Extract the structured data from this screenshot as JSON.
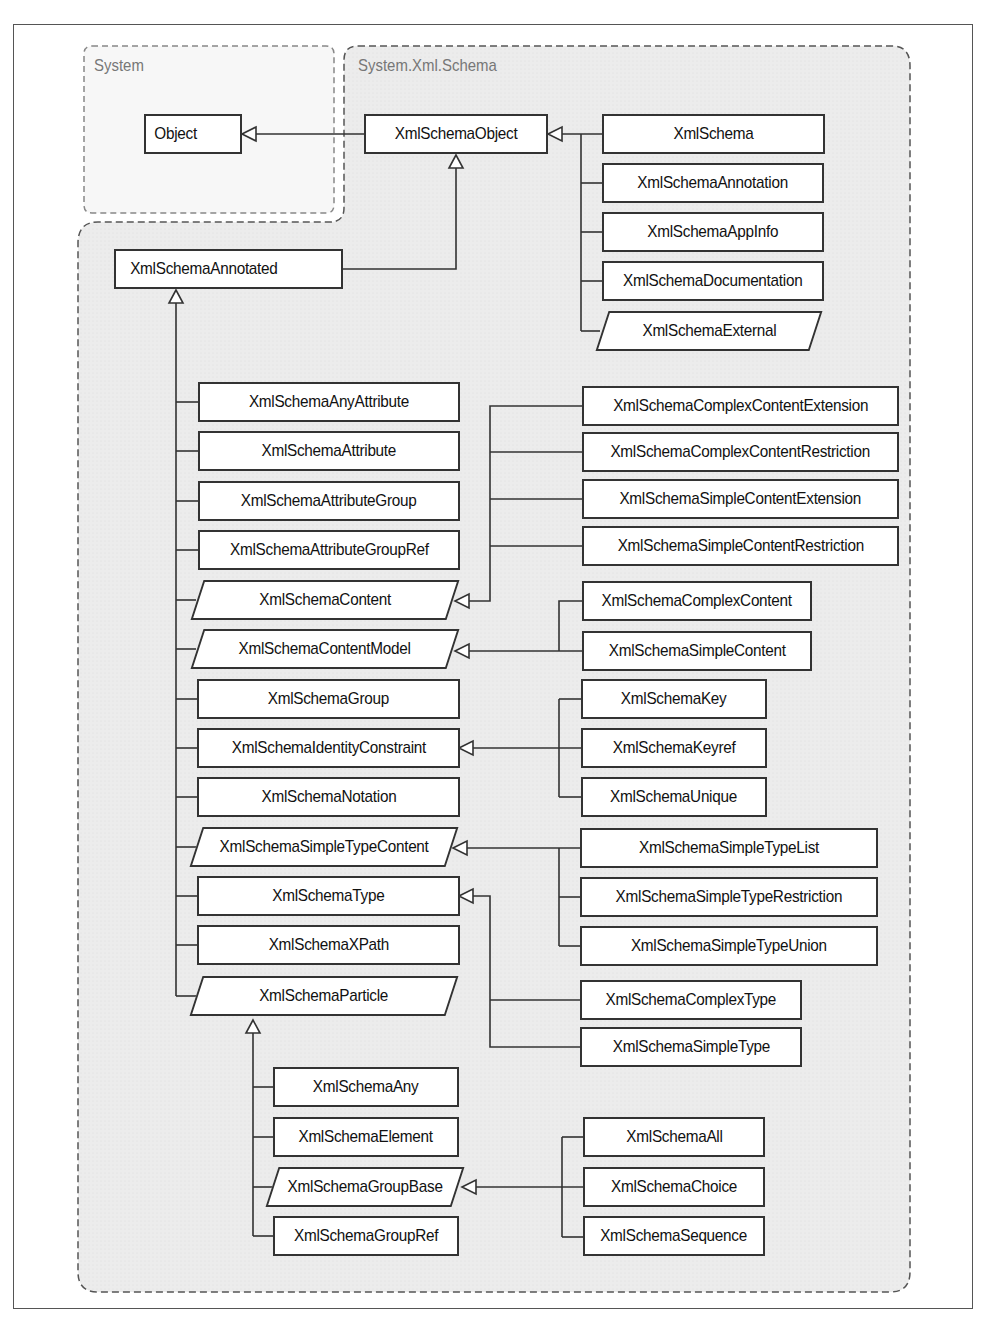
{
  "packages": {
    "system": "System",
    "xml_schema": "System.Xml.Schema"
  },
  "nodes": {
    "object": "Object",
    "xml_schema_object": "XmlSchemaObject",
    "xml_schema": "XmlSchema",
    "xml_schema_annotation": "XmlSchemaAnnotation",
    "xml_schema_appinfo": "XmlSchemaAppInfo",
    "xml_schema_documentation": "XmlSchemaDocumentation",
    "xml_schema_external": "XmlSchemaExternal",
    "xml_schema_annotated": "XmlSchemaAnnotated",
    "any_attribute": "XmlSchemaAnyAttribute",
    "attribute": "XmlSchemaAttribute",
    "attribute_group": "XmlSchemaAttributeGroup",
    "attribute_group_ref": "XmlSchemaAttributeGroupRef",
    "content": "XmlSchemaContent",
    "content_model": "XmlSchemaContentModel",
    "group": "XmlSchemaGroup",
    "identity_constraint": "XmlSchemaIdentityConstraint",
    "notation": "XmlSchemaNotation",
    "simple_type_content": "XmlSchemaSimpleTypeContent",
    "type": "XmlSchemaType",
    "xpath": "XmlSchemaXPath",
    "particle": "XmlSchemaParticle",
    "complex_content_extension": "XmlSchemaComplexContentExtension",
    "complex_content_restriction": "XmlSchemaComplexContentRestriction",
    "simple_content_extension": "XmlSchemaSimpleContentExtension",
    "simple_content_restriction": "XmlSchemaSimpleContentRestriction",
    "complex_content": "XmlSchemaComplexContent",
    "simple_content": "XmlSchemaSimpleContent",
    "key": "XmlSchemaKey",
    "keyref": "XmlSchemaKeyref",
    "unique": "XmlSchemaUnique",
    "simple_type_list": "XmlSchemaSimpleTypeList",
    "simple_type_restriction": "XmlSchemaSimpleTypeRestriction",
    "simple_type_union": "XmlSchemaSimpleTypeUnion",
    "complex_type": "XmlSchemaComplexType",
    "simple_type": "XmlSchemaSimpleType",
    "any": "XmlSchemaAny",
    "element": "XmlSchemaElement",
    "group_base": "XmlSchemaGroupBase",
    "group_ref": "XmlSchemaGroupRef",
    "all": "XmlSchemaAll",
    "choice": "XmlSchemaChoice",
    "sequence": "XmlSchemaSequence"
  }
}
